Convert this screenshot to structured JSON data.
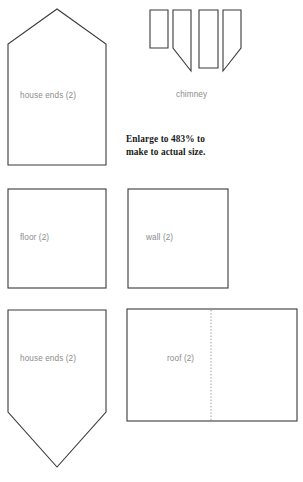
{
  "page": {
    "background_color": "#ffffff",
    "outline_color": "#3a3a3a",
    "label_color": "#8c8c8c",
    "fold_line_color": "#9a9a9a",
    "note_color": "#1a1a1a"
  },
  "note": {
    "line1": "Enlarge to 483% to",
    "line2": "make to actual size.",
    "percent": "483%"
  },
  "pieces": [
    {
      "id": "house-ends-top",
      "label": "house ends (2)",
      "shape": "pentagon-house",
      "quantity": 2
    },
    {
      "id": "chimney",
      "label": "chimney",
      "shape": "strips",
      "quantity": 4
    },
    {
      "id": "floor",
      "label": "floor (2)",
      "shape": "square",
      "quantity": 2
    },
    {
      "id": "wall",
      "label": "wall (2)",
      "shape": "square",
      "quantity": 2
    },
    {
      "id": "house-ends-bottom",
      "label": "house ends (2)",
      "shape": "pentagon-point-down",
      "quantity": 2
    },
    {
      "id": "roof",
      "label": "roof (2)",
      "shape": "rectangle-with-fold",
      "quantity": 2
    }
  ]
}
